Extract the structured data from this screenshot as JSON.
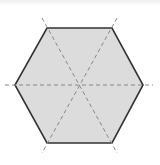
{
  "diagram": {
    "shape": "regular-hexagon",
    "fill_color": "#dcdcdc",
    "outline_color": "#333333",
    "symmetry_line_color": "#888888",
    "vertices": [
      {
        "x": 47,
        "y": 28
      },
      {
        "x": 112,
        "y": 28
      },
      {
        "x": 143,
        "y": 85
      },
      {
        "x": 112,
        "y": 143
      },
      {
        "x": 47,
        "y": 143
      },
      {
        "x": 15,
        "y": 85
      }
    ],
    "center": {
      "x": 80,
      "y": 85
    },
    "symmetry_lines": [
      {
        "name": "horizontal-axis",
        "x1": 5,
        "y1": 85,
        "x2": 153,
        "y2": 85
      },
      {
        "name": "diagonal-axis-1",
        "x1": 42,
        "y1": 18,
        "x2": 117,
        "y2": 153
      },
      {
        "name": "diagonal-axis-2",
        "x1": 117,
        "y1": 18,
        "x2": 42,
        "y2": 153
      }
    ],
    "symmetry_line_count": 3
  }
}
